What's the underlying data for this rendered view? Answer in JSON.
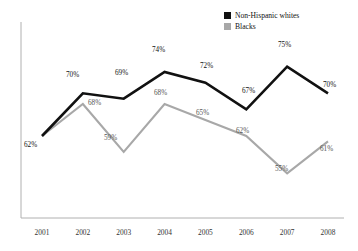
{
  "chart_data": {
    "type": "line",
    "title": "",
    "xlabel": "",
    "ylabel": "",
    "categories": [
      "2001",
      "2002",
      "2003",
      "2004",
      "2005",
      "2006",
      "2007",
      "2008"
    ],
    "ylim": [
      50,
      80
    ],
    "grid": false,
    "legend_position": "top-right",
    "series": [
      {
        "name": "Non-Hispanic whites",
        "color": "#111111",
        "values": [
          62,
          70,
          69,
          74,
          72,
          67,
          75,
          70
        ],
        "data_labels": [
          "62%",
          "70%",
          "69%",
          "74%",
          "72%",
          "67%",
          "75%",
          "70%"
        ]
      },
      {
        "name": "Blacks",
        "color": "#a8a8a8",
        "values": [
          62,
          68,
          59,
          68,
          65,
          62,
          55,
          61
        ],
        "data_labels": [
          "62%",
          "68%",
          "59%",
          "68%",
          "65%",
          "62%",
          "55%",
          "61%"
        ]
      }
    ]
  },
  "legend": {
    "items": [
      {
        "label": "Non-Hispanic whites",
        "color": "#111111"
      },
      {
        "label": "Blacks",
        "color": "#a8a8a8"
      }
    ]
  },
  "axis": {
    "x_tick_labels": [
      "2001",
      "2002",
      "2003",
      "2004",
      "2005",
      "2006",
      "2007",
      "2008"
    ],
    "axis_color": "#b0b0b0"
  },
  "labels": {
    "white": [
      {
        "text": "62%",
        "x": 24,
        "y": 142
      },
      {
        "text": "70%",
        "x": 66,
        "y": 72
      },
      {
        "text": "69%",
        "x": 115,
        "y": 70
      },
      {
        "text": "74%",
        "x": 152,
        "y": 47
      },
      {
        "text": "72%",
        "x": 200,
        "y": 63
      },
      {
        "text": "67%",
        "x": 242,
        "y": 88
      },
      {
        "text": "75%",
        "x": 278,
        "y": 42
      },
      {
        "text": "70%",
        "x": 323,
        "y": 82
      }
    ],
    "blackSeries": [
      {
        "text": "68%",
        "x": 88,
        "y": 100
      },
      {
        "text": "59%",
        "x": 104,
        "y": 135
      },
      {
        "text": "68%",
        "x": 154,
        "y": 90
      },
      {
        "text": "65%",
        "x": 196,
        "y": 110
      },
      {
        "text": "62%",
        "x": 236,
        "y": 128
      },
      {
        "text": "55%",
        "x": 275,
        "y": 166
      },
      {
        "text": "61%",
        "x": 320,
        "y": 146
      }
    ]
  }
}
